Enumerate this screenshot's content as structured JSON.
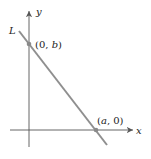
{
  "diagram": {
    "axes": {
      "x_label": "x",
      "y_label": "y"
    },
    "line": {
      "label": "L",
      "color": "#8f8f8f"
    },
    "points": [
      {
        "label": "(0, b)",
        "pre": "(0, ",
        "var": "b",
        "post": ")"
      },
      {
        "label": "(a, 0)",
        "pre": "(",
        "var": "a",
        "post": ", 0)"
      }
    ],
    "colors": {
      "axis": "#555555",
      "line": "#8f8f8f",
      "point": "#8a8a8a"
    }
  }
}
